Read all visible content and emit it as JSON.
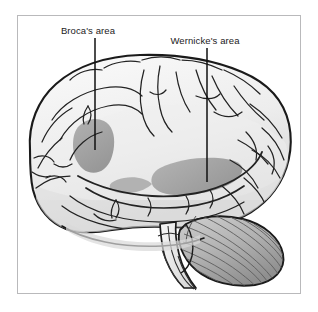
{
  "figure": {
    "kind": "anatomical-diagram",
    "frame_color": "#b9b9bb",
    "background_color": "#ffffff"
  },
  "labels": [
    {
      "id": "brocas",
      "text": "Broca's area",
      "text_x": 88,
      "text_y": 34,
      "leader_x": 95,
      "leader_y_start": 38,
      "leader_y_end": 150
    },
    {
      "id": "wernickes",
      "text": "Wernicke's area",
      "text_x": 192,
      "text_y": 44,
      "leader_x": 207,
      "leader_y_start": 48,
      "leader_y_end": 182
    }
  ],
  "regions": [
    {
      "id": "brocas-area-shading",
      "name": "Broca's area",
      "fill": "#a5a5a5"
    },
    {
      "id": "wernickes-area-shading",
      "name": "Wernicke's area",
      "fill": "#a5a5a5"
    }
  ],
  "structures": [
    {
      "id": "cerebrum",
      "name": "Cerebrum",
      "fill": "#f2f2f2"
    },
    {
      "id": "cerebellum",
      "name": "Cerebellum",
      "fill": "#b5b5b5"
    },
    {
      "id": "brainstem",
      "name": "Brain stem",
      "fill": "#ececec"
    }
  ],
  "colors": {
    "outline": "#1a1a1a",
    "sulci": "#2b2b2b",
    "shading_gray": "#a5a5a5",
    "cerebellum_gray": "#b0b0b0",
    "cortex_light": "#f4f4f4",
    "cortex_mid": "#e2e2e2",
    "frame": "#b9b9bb"
  }
}
